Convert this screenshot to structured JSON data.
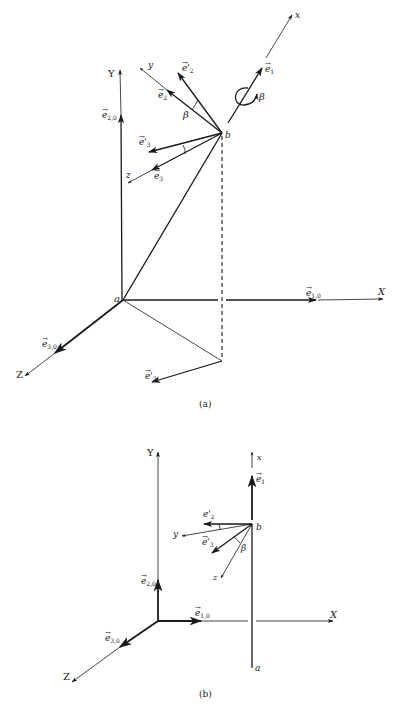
{
  "figure": {
    "panel_a": {
      "caption": "(a)",
      "points": {
        "a": "a",
        "b": "b"
      },
      "global_axes": {
        "X": "X",
        "Y": "Y",
        "Z": "Z"
      },
      "body_axes": {
        "x": "x",
        "y": "y",
        "z": "z"
      },
      "unit_vectors": {
        "e10": "e",
        "e10_sub": "1,0",
        "e20": "e",
        "e20_sub": "2,0",
        "e30": "e",
        "e30_sub": "3,0",
        "e1": "e",
        "e1_sub": "1",
        "e2": "e",
        "e2_sub": "2",
        "e3": "e",
        "e3_sub": "3",
        "e2p": "e'",
        "e2p_sub": "2",
        "e3p": "e'",
        "e3p_sub": "3",
        "e3p_proj": "e'",
        "e3p_proj_sub": "3"
      },
      "angle_label": "β",
      "rotation_label": "β"
    },
    "panel_b": {
      "caption": "(b)",
      "points": {
        "a": "a",
        "b": "b"
      },
      "global_axes": {
        "X": "X",
        "Y": "Y",
        "Z": "Z"
      },
      "body_axes": {
        "x": "x",
        "y": "y",
        "z": "z"
      },
      "unit_vectors": {
        "e10": "e",
        "e10_sub": "1,0",
        "e20": "e",
        "e20_sub": "2,0",
        "e30": "e",
        "e30_sub": "3,0",
        "e1": "e",
        "e1_sub": "1",
        "e2p": "e'",
        "e2p_sub": "2",
        "e3p": "e'",
        "e3p_sub": "3"
      },
      "angle_label": "β"
    },
    "colors": {
      "ink": "#1a1a1a",
      "background": "#ffffff"
    }
  }
}
